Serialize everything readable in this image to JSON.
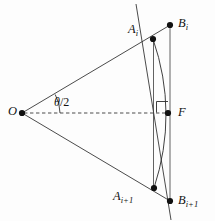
{
  "figure": {
    "type": "geometry-diagram",
    "background_color": "#fdfdfd",
    "stroke_color": "#1a1a1a",
    "point_color": "#111111",
    "width": 215,
    "height": 221
  },
  "labels": {
    "center": "O",
    "foot": "F",
    "arc_point_top": "A",
    "arc_point_top_sub": "i",
    "outer_point_top": "B",
    "outer_point_top_sub": "i",
    "arc_point_bottom": "A",
    "arc_point_bottom_sub": "i+1",
    "outer_point_bottom": "B",
    "outer_point_bottom_sub": "i+1",
    "angle": "/2",
    "angle_symbol": "θ"
  },
  "geometry": {
    "points": {
      "O": {
        "x": 22,
        "y": 113
      },
      "A_i": {
        "x": 153,
        "y": 39
      },
      "B_i": {
        "x": 170,
        "y": 25
      },
      "A_ip1": {
        "x": 154,
        "y": 188
      },
      "B_ip1": {
        "x": 170,
        "y": 201
      },
      "F": {
        "x": 168,
        "y": 113
      }
    },
    "chord_line": {
      "x1": 137,
      "y1": 5,
      "x2": 170,
      "y2": 221
    },
    "axis_dashed": {
      "x1": 22,
      "y1": 113,
      "x2": 168,
      "y2": 113
    },
    "vertical_chord": {
      "x": 153.5,
      "y1": 39,
      "y2": 188
    },
    "vertical_outer": {
      "x": 170,
      "y1": 25,
      "y2": 201
    },
    "arc": {
      "start_x": 153,
      "start_y": 39,
      "end_x": 154,
      "end_y": 188,
      "bulge_x": 171,
      "bulge_y": 113
    },
    "right_angle_marker": {
      "x": 157,
      "y": 101,
      "size": 11
    },
    "angle_arc": {
      "cx": 22,
      "cy": 113,
      "r": 38,
      "from_deg": -29,
      "to_deg": 0
    }
  }
}
